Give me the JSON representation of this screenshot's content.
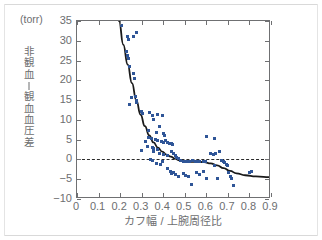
{
  "figure": {
    "unit_label": "(torr)",
    "xaxis_title": "カフ幅 / 上腕周径比",
    "yaxis_title_chars": [
      "非",
      "観",
      "血",
      "—",
      "観",
      "血",
      "血",
      "圧",
      "差"
    ],
    "accent_color": "#2f5597",
    "curve_color": "#1a1a1a",
    "axis_color": "#6f7072",
    "text_color": "#6d6e70"
  },
  "chart_data": {
    "type": "scatter",
    "title": "",
    "subtitle": "",
    "xlabel": "カフ幅 / 上腕周径比",
    "ylabel": "非観血—観血血圧差",
    "yunit": "(torr)",
    "xlim": [
      0,
      0.9
    ],
    "ylim": [
      -10,
      35
    ],
    "xticks": [
      0,
      0.1,
      0.2,
      0.3,
      0.4,
      0.5,
      0.6,
      0.7,
      0.8,
      0.9
    ],
    "xticklabels": [
      "0",
      "0.1",
      "0.2",
      "0.3",
      "0.4",
      "0.5",
      "0.6",
      "0.7",
      "0.8",
      "0.9"
    ],
    "yticks": [
      -10,
      -5,
      0,
      5,
      10,
      15,
      20,
      25,
      30,
      35
    ],
    "yticklabels": [
      "-10",
      "-5",
      "0",
      "5",
      "10",
      "15",
      "20",
      "25",
      "30",
      "35"
    ],
    "grid": false,
    "legend": null,
    "reference_lines": [
      {
        "type": "hline",
        "y": 0,
        "style": "dashed",
        "color": "#2b2b2b"
      }
    ],
    "series": [
      {
        "name": "観測値",
        "type": "scatter",
        "color": "#2f5597",
        "marker": "square",
        "points": [
          [
            0.205,
            33.8
          ],
          [
            0.232,
            31.0
          ],
          [
            0.238,
            30.2
          ],
          [
            0.262,
            31.2
          ],
          [
            0.228,
            27.3
          ],
          [
            0.233,
            26.2
          ],
          [
            0.237,
            25.4
          ],
          [
            0.242,
            23.6
          ],
          [
            0.262,
            21.7
          ],
          [
            0.268,
            20.4
          ],
          [
            0.252,
            15.6
          ],
          [
            0.272,
            15.8
          ],
          [
            0.276,
            14.9
          ],
          [
            0.278,
            14.4
          ],
          [
            0.245,
            13.9
          ],
          [
            0.3,
            12.1
          ],
          [
            0.305,
            11.6
          ],
          [
            0.338,
            11.8
          ],
          [
            0.352,
            11.0
          ],
          [
            0.372,
            11.3
          ],
          [
            0.398,
            11.0
          ],
          [
            0.355,
            10.0
          ],
          [
            0.382,
            8.3
          ],
          [
            0.33,
            7.4
          ],
          [
            0.368,
            6.8
          ],
          [
            0.4,
            6.6
          ],
          [
            0.408,
            6.0
          ],
          [
            0.332,
            5.6
          ],
          [
            0.345,
            5.2
          ],
          [
            0.362,
            5.1
          ],
          [
            0.372,
            4.8
          ],
          [
            0.392,
            4.6
          ],
          [
            0.402,
            4.4
          ],
          [
            0.412,
            4.8
          ],
          [
            0.418,
            4.3
          ],
          [
            0.43,
            4.1
          ],
          [
            0.437,
            4.0
          ],
          [
            0.443,
            3.8
          ],
          [
            0.318,
            4.6
          ],
          [
            0.327,
            3.2
          ],
          [
            0.348,
            3.0
          ],
          [
            0.357,
            2.8
          ],
          [
            0.372,
            2.6
          ],
          [
            0.3,
            2.2
          ],
          [
            0.355,
            1.9
          ],
          [
            0.382,
            1.6
          ],
          [
            0.4,
            1.3
          ],
          [
            0.422,
            1.1
          ],
          [
            0.44,
            1.9
          ],
          [
            0.448,
            1.5
          ],
          [
            0.455,
            0.9
          ],
          [
            0.462,
            0.6
          ],
          [
            0.47,
            0.3
          ],
          [
            0.34,
            0.1
          ],
          [
            0.352,
            -0.3
          ],
          [
            0.368,
            -0.9
          ],
          [
            0.388,
            -1.4
          ],
          [
            0.398,
            -0.6
          ],
          [
            0.482,
            -0.2
          ],
          [
            0.492,
            -0.5
          ],
          [
            0.502,
            -0.4
          ],
          [
            0.512,
            -0.6
          ],
          [
            0.524,
            -0.5
          ],
          [
            0.534,
            -0.3
          ],
          [
            0.548,
            -0.6
          ],
          [
            0.558,
            -0.4
          ],
          [
            0.57,
            -0.5
          ],
          [
            0.585,
            -0.4
          ],
          [
            0.598,
            -0.6
          ],
          [
            0.418,
            -2.3
          ],
          [
            0.432,
            -3.0
          ],
          [
            0.44,
            -3.6
          ],
          [
            0.448,
            -3.3
          ],
          [
            0.456,
            -3.8
          ],
          [
            0.47,
            -4.2
          ],
          [
            0.492,
            -3.6
          ],
          [
            0.505,
            -4.1
          ],
          [
            0.518,
            -4.4
          ],
          [
            0.53,
            -6.4
          ],
          [
            0.553,
            -3.3
          ],
          [
            0.57,
            -3.8
          ],
          [
            0.585,
            -3.0
          ],
          [
            0.6,
            -4.8
          ],
          [
            0.602,
            5.9
          ],
          [
            0.638,
            5.2
          ],
          [
            0.618,
            1.6
          ],
          [
            0.632,
            1.2
          ],
          [
            0.644,
            1.4
          ],
          [
            0.66,
            2.1
          ],
          [
            0.672,
            -0.2
          ],
          [
            0.678,
            -0.4
          ],
          [
            0.686,
            -0.7
          ],
          [
            0.694,
            -1.2
          ],
          [
            0.7,
            -1.5
          ],
          [
            0.704,
            -3.3
          ],
          [
            0.71,
            -4.4
          ],
          [
            0.716,
            -4.9
          ],
          [
            0.726,
            -6.6
          ],
          [
            0.64,
            -1.6
          ],
          [
            0.652,
            -4.9
          ],
          [
            0.8,
            -3.4
          ],
          [
            0.808,
            -3.0
          ],
          [
            0.278,
            32.0
          ]
        ]
      },
      {
        "name": "回帰曲線",
        "type": "line",
        "color": "#1a1a1a",
        "points": [
          [
            0.195,
            35.0
          ],
          [
            0.215,
            29.0
          ],
          [
            0.235,
            24.0
          ],
          [
            0.255,
            19.3
          ],
          [
            0.275,
            15.0
          ],
          [
            0.295,
            11.3
          ],
          [
            0.315,
            8.4
          ],
          [
            0.335,
            6.1
          ],
          [
            0.355,
            4.3
          ],
          [
            0.375,
            3.0
          ],
          [
            0.395,
            2.0
          ],
          [
            0.415,
            1.2
          ],
          [
            0.435,
            0.7
          ],
          [
            0.455,
            0.2
          ],
          [
            0.475,
            -0.2
          ],
          [
            0.5,
            -0.5
          ],
          [
            0.53,
            -0.6
          ],
          [
            0.56,
            -0.6
          ],
          [
            0.59,
            -0.7
          ],
          [
            0.62,
            -1.0
          ],
          [
            0.65,
            -1.5
          ],
          [
            0.68,
            -2.2
          ],
          [
            0.71,
            -2.9
          ],
          [
            0.74,
            -3.5
          ],
          [
            0.78,
            -4.0
          ],
          [
            0.83,
            -4.3
          ],
          [
            0.9,
            -4.5
          ]
        ]
      }
    ]
  }
}
